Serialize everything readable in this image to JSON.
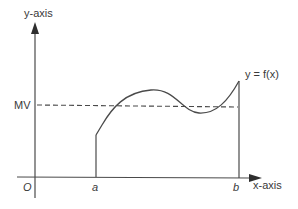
{
  "diagram": {
    "y_axis_label": "y-axis",
    "x_axis_label": "x-axis",
    "origin_label": "O",
    "mean_value_label": "MV",
    "lower_bound_label": "a",
    "upper_bound_label": "b",
    "function_label": "y = f(x)"
  },
  "colors": {
    "ink": "#4a4a4a",
    "text": "#3a3a3a",
    "background": "#ffffff"
  }
}
